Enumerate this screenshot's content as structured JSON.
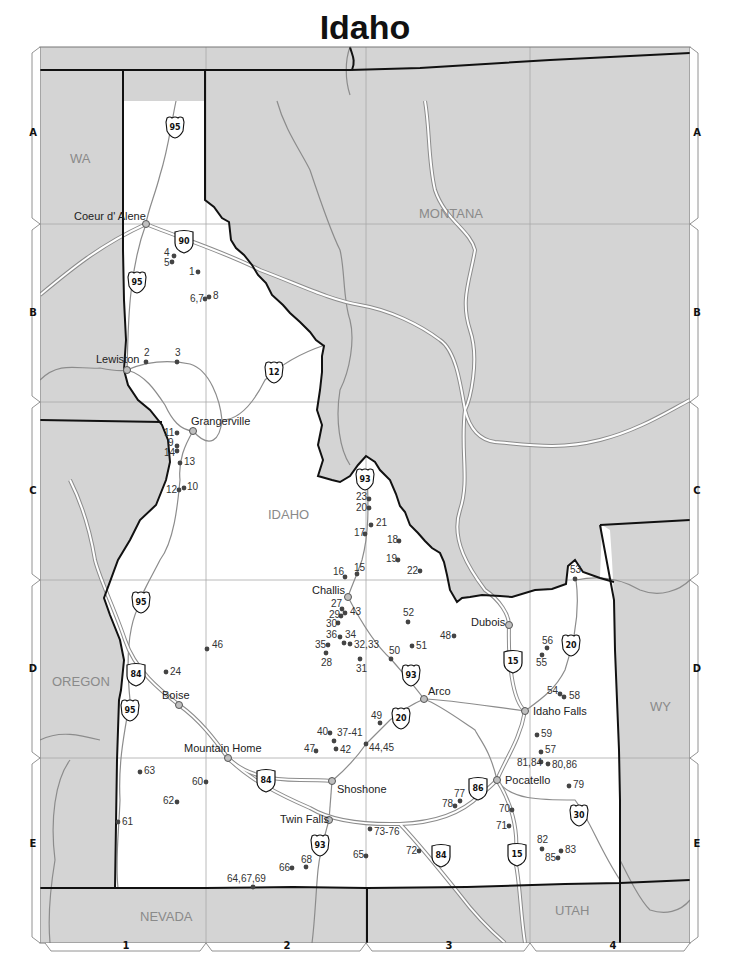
{
  "title": "Idaho",
  "colors": {
    "land_other": "#d4d4d4",
    "land_idaho": "#ffffff",
    "border": "#111111",
    "grid": "#a8a8a8",
    "road_minor": "#8c8c8c",
    "interstate_casing": "#8c8c8c",
    "site_dot": "#444444",
    "city_fill": "#bfbfbf"
  },
  "grid": {
    "rows": [
      {
        "label": "A",
        "y": 132
      },
      {
        "label": "B",
        "y": 312
      },
      {
        "label": "C",
        "y": 490
      },
      {
        "label": "D",
        "y": 668
      },
      {
        "label": "E",
        "y": 843
      }
    ],
    "columns": [
      {
        "label": "1",
        "x": 126
      },
      {
        "label": "2",
        "x": 287
      },
      {
        "label": "3",
        "x": 449
      },
      {
        "label": "4",
        "x": 613
      }
    ]
  },
  "state_labels": [
    {
      "text": "WA",
      "x": 70,
      "y": 163
    },
    {
      "text": "MONTANA",
      "x": 419,
      "y": 218
    },
    {
      "text": "IDAHO",
      "x": 268,
      "y": 519
    },
    {
      "text": "OREGON",
      "x": 52,
      "y": 686
    },
    {
      "text": "WY",
      "x": 650,
      "y": 711
    },
    {
      "text": "NEVADA",
      "x": 140,
      "y": 921
    },
    {
      "text": "UTAH",
      "x": 555,
      "y": 915
    }
  ],
  "cities": [
    {
      "name": "Coeur d' Alene",
      "x": 146,
      "y": 224,
      "lx": 74,
      "ly": 220
    },
    {
      "name": "Lewiston",
      "x": 127,
      "y": 370,
      "lx": 96,
      "ly": 363
    },
    {
      "name": "Grangerville",
      "x": 193,
      "y": 431,
      "lx": 191,
      "ly": 425
    },
    {
      "name": "Challis",
      "x": 348,
      "y": 597,
      "lx": 312,
      "ly": 594
    },
    {
      "name": "Dubois",
      "x": 509,
      "y": 625,
      "lx": 471,
      "ly": 626
    },
    {
      "name": "Arco",
      "x": 424,
      "y": 699,
      "lx": 428,
      "ly": 695
    },
    {
      "name": "Idaho Falls",
      "x": 525,
      "y": 711,
      "lx": 533,
      "ly": 715
    },
    {
      "name": "Boise",
      "x": 179,
      "y": 705,
      "lx": 162,
      "ly": 699
    },
    {
      "name": "Mountain Home",
      "x": 228,
      "y": 758,
      "lx": 184,
      "ly": 752
    },
    {
      "name": "Shoshone",
      "x": 332,
      "y": 781,
      "lx": 337,
      "ly": 793
    },
    {
      "name": "Pocatello",
      "x": 497,
      "y": 780,
      "lx": 505,
      "ly": 784
    },
    {
      "name": "Twin Falls",
      "x": 329,
      "y": 820,
      "lx": 280,
      "ly": 823
    }
  ],
  "sites": [
    {
      "label": "1",
      "x": 198,
      "y": 272,
      "lx": 189,
      "ly": 275
    },
    {
      "label": "2",
      "x": 146,
      "y": 362,
      "lx": 144,
      "ly": 356
    },
    {
      "label": "3",
      "x": 177,
      "y": 362,
      "lx": 175,
      "ly": 356
    },
    {
      "label": "4",
      "x": 174,
      "y": 256,
      "lx": 164,
      "ly": 256
    },
    {
      "label": "5",
      "x": 172,
      "y": 262,
      "lx": 164,
      "ly": 266
    },
    {
      "label": "6,7",
      "x": 205,
      "y": 299,
      "lx": 190,
      "ly": 302
    },
    {
      "label": "8",
      "x": 209,
      "y": 297,
      "lx": 213,
      "ly": 299
    },
    {
      "label": "9",
      "x": 177,
      "y": 446,
      "lx": 168,
      "ly": 446
    },
    {
      "label": "10",
      "x": 184,
      "y": 488,
      "lx": 187,
      "ly": 490
    },
    {
      "label": "11",
      "x": 177,
      "y": 433,
      "lx": 164,
      "ly": 436
    },
    {
      "label": "12",
      "x": 179,
      "y": 490,
      "lx": 166,
      "ly": 493
    },
    {
      "label": "13",
      "x": 180,
      "y": 463,
      "lx": 184,
      "ly": 465
    },
    {
      "label": "14",
      "x": 177,
      "y": 451,
      "lx": 164,
      "ly": 456
    },
    {
      "label": "15",
      "x": 357,
      "y": 574,
      "lx": 354,
      "ly": 571
    },
    {
      "label": "16",
      "x": 345,
      "y": 577,
      "lx": 333,
      "ly": 575
    },
    {
      "label": "17",
      "x": 365,
      "y": 534,
      "lx": 354,
      "ly": 536
    },
    {
      "label": "18",
      "x": 399,
      "y": 541,
      "lx": 387,
      "ly": 543
    },
    {
      "label": "19",
      "x": 398,
      "y": 560,
      "lx": 386,
      "ly": 562
    },
    {
      "label": "20",
      "x": 369,
      "y": 508,
      "lx": 356,
      "ly": 511
    },
    {
      "label": "21",
      "x": 371,
      "y": 525,
      "lx": 376,
      "ly": 526
    },
    {
      "label": "22",
      "x": 420,
      "y": 571,
      "lx": 407,
      "ly": 574
    },
    {
      "label": "23",
      "x": 369,
      "y": 499,
      "lx": 356,
      "ly": 500
    },
    {
      "label": "24",
      "x": 166,
      "y": 672,
      "lx": 170,
      "ly": 675
    },
    {
      "label": "27",
      "x": 342,
      "y": 609,
      "lx": 331,
      "ly": 607
    },
    {
      "label": "28",
      "x": 326,
      "y": 653,
      "lx": 321,
      "ly": 666
    },
    {
      "label": "29",
      "x": 341,
      "y": 616,
      "lx": 329,
      "ly": 618
    },
    {
      "label": "30",
      "x": 338,
      "y": 623,
      "lx": 326,
      "ly": 627
    },
    {
      "label": "31",
      "x": 360,
      "y": 659,
      "lx": 356,
      "ly": 672
    },
    {
      "label": "32,33",
      "x": 350,
      "y": 644,
      "lx": 354,
      "ly": 648
    },
    {
      "label": "34",
      "x": 344,
      "y": 643,
      "lx": 345,
      "ly": 638
    },
    {
      "label": "35",
      "x": 328,
      "y": 645,
      "lx": 315,
      "ly": 648
    },
    {
      "label": "36",
      "x": 340,
      "y": 637,
      "lx": 326,
      "ly": 638
    },
    {
      "label": "37-41",
      "x": 334,
      "y": 741,
      "lx": 337,
      "ly": 736
    },
    {
      "label": "40",
      "x": 330,
      "y": 733,
      "lx": 317,
      "ly": 735
    },
    {
      "label": "42",
      "x": 336,
      "y": 749,
      "lx": 340,
      "ly": 753
    },
    {
      "label": "43",
      "x": 345,
      "y": 613,
      "lx": 350,
      "ly": 615
    },
    {
      "label": "44,45",
      "x": 366,
      "y": 744,
      "lx": 369,
      "ly": 751
    },
    {
      "label": "46",
      "x": 207,
      "y": 649,
      "lx": 212,
      "ly": 648
    },
    {
      "label": "47",
      "x": 316,
      "y": 751,
      "lx": 304,
      "ly": 752
    },
    {
      "label": "48",
      "x": 454,
      "y": 636,
      "lx": 440,
      "ly": 639
    },
    {
      "label": "49",
      "x": 380,
      "y": 723,
      "lx": 371,
      "ly": 719
    },
    {
      "label": "50",
      "x": 391,
      "y": 659,
      "lx": 389,
      "ly": 654
    },
    {
      "label": "51",
      "x": 412,
      "y": 646,
      "lx": 416,
      "ly": 649
    },
    {
      "label": "52",
      "x": 408,
      "y": 622,
      "lx": 403,
      "ly": 616
    },
    {
      "label": "53",
      "x": 575,
      "y": 579,
      "lx": 570,
      "ly": 573
    },
    {
      "label": "54",
      "x": 560,
      "y": 694,
      "lx": 547,
      "ly": 694
    },
    {
      "label": "55",
      "x": 542,
      "y": 655,
      "lx": 536,
      "ly": 666
    },
    {
      "label": "56",
      "x": 547,
      "y": 648,
      "lx": 542,
      "ly": 644
    },
    {
      "label": "57",
      "x": 541,
      "y": 752,
      "lx": 545,
      "ly": 753
    },
    {
      "label": "58",
      "x": 564,
      "y": 697,
      "lx": 569,
      "ly": 699
    },
    {
      "label": "59",
      "x": 537,
      "y": 735,
      "lx": 541,
      "ly": 737
    },
    {
      "label": "60",
      "x": 206,
      "y": 782,
      "lx": 192,
      "ly": 785
    },
    {
      "label": "61",
      "x": 118,
      "y": 822,
      "lx": 122,
      "ly": 825
    },
    {
      "label": "62",
      "x": 177,
      "y": 802,
      "lx": 163,
      "ly": 804
    },
    {
      "label": "63",
      "x": 140,
      "y": 772,
      "lx": 144,
      "ly": 774
    },
    {
      "label": "64,67,69",
      "x": 253,
      "y": 887,
      "lx": 227,
      "ly": 882
    },
    {
      "label": "65",
      "x": 366,
      "y": 856,
      "lx": 353,
      "ly": 858
    },
    {
      "label": "66",
      "x": 292,
      "y": 868,
      "lx": 279,
      "ly": 871
    },
    {
      "label": "68",
      "x": 306,
      "y": 867,
      "lx": 301,
      "ly": 863
    },
    {
      "label": "70",
      "x": 512,
      "y": 810,
      "lx": 499,
      "ly": 812
    },
    {
      "label": "71",
      "x": 509,
      "y": 826,
      "lx": 496,
      "ly": 829
    },
    {
      "label": "72",
      "x": 419,
      "y": 851,
      "lx": 406,
      "ly": 854
    },
    {
      "label": "73-76",
      "x": 370,
      "y": 829,
      "lx": 374,
      "ly": 835
    },
    {
      "label": "77",
      "x": 460,
      "y": 801,
      "lx": 454,
      "ly": 797
    },
    {
      "label": "78",
      "x": 455,
      "y": 806,
      "lx": 442,
      "ly": 807
    },
    {
      "label": "79",
      "x": 569,
      "y": 786,
      "lx": 573,
      "ly": 788
    },
    {
      "label": "80,86",
      "x": 548,
      "y": 764,
      "lx": 552,
      "ly": 768
    },
    {
      "label": "81,84",
      "x": 541,
      "y": 762,
      "lx": 517,
      "ly": 766
    },
    {
      "label": "82",
      "x": 542,
      "y": 849,
      "lx": 537,
      "ly": 843
    },
    {
      "label": "83",
      "x": 561,
      "y": 851,
      "lx": 565,
      "ly": 853
    },
    {
      "label": "85",
      "x": 558,
      "y": 858,
      "lx": 545,
      "ly": 861
    }
  ],
  "shields": [
    {
      "type": "us",
      "number": "95",
      "x": 175,
      "y": 127
    },
    {
      "type": "us",
      "number": "95",
      "x": 137,
      "y": 282
    },
    {
      "type": "us",
      "number": "95",
      "x": 141,
      "y": 602
    },
    {
      "type": "us",
      "number": "95",
      "x": 130,
      "y": 710
    },
    {
      "type": "interstate",
      "number": "90",
      "x": 184,
      "y": 241
    },
    {
      "type": "us",
      "number": "12",
      "x": 274,
      "y": 372
    },
    {
      "type": "us",
      "number": "93",
      "x": 365,
      "y": 479
    },
    {
      "type": "us",
      "number": "93",
      "x": 411,
      "y": 675
    },
    {
      "type": "us",
      "number": "93",
      "x": 320,
      "y": 845
    },
    {
      "type": "interstate",
      "number": "84",
      "x": 136,
      "y": 674
    },
    {
      "type": "interstate",
      "number": "84",
      "x": 266,
      "y": 780
    },
    {
      "type": "interstate",
      "number": "84",
      "x": 441,
      "y": 855
    },
    {
      "type": "us",
      "number": "20",
      "x": 401,
      "y": 718
    },
    {
      "type": "us",
      "number": "20",
      "x": 571,
      "y": 645
    },
    {
      "type": "interstate",
      "number": "15",
      "x": 513,
      "y": 661
    },
    {
      "type": "interstate",
      "number": "15",
      "x": 517,
      "y": 854
    },
    {
      "type": "interstate",
      "number": "86",
      "x": 478,
      "y": 788
    },
    {
      "type": "us",
      "number": "30",
      "x": 579,
      "y": 815
    }
  ]
}
